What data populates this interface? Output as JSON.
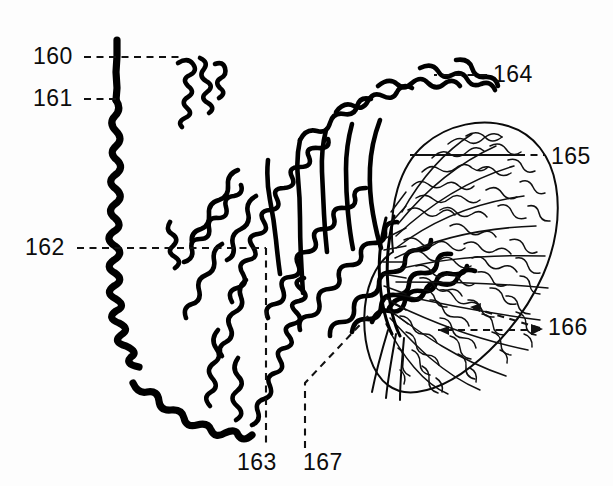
{
  "figure": {
    "background_color": "#fdfdfd",
    "ink_color": "#000000",
    "width": 613,
    "height": 486,
    "style": "patent line drawing"
  },
  "labels": [
    {
      "id": "160",
      "text": "160",
      "x": 33,
      "y": 64,
      "leader": "dashed-horizontal-right"
    },
    {
      "id": "161",
      "text": "161",
      "x": 33,
      "y": 106,
      "leader": "dashed-horizontal-right"
    },
    {
      "id": "162",
      "text": "162",
      "x": 25,
      "y": 255,
      "leader": "dashed-horizontal-right"
    },
    {
      "id": "163",
      "text": "163",
      "x": 237,
      "y": 470,
      "leader": "dashed-vertical-up"
    },
    {
      "id": "164",
      "text": "164",
      "x": 493,
      "y": 82,
      "leader": "dashed-horizontal-left"
    },
    {
      "id": "165",
      "text": "165",
      "x": 551,
      "y": 164,
      "leader": "solid-then-dashed-left"
    },
    {
      "id": "166",
      "text": "166",
      "x": 548,
      "y": 335,
      "leader": "dashed-double-arrow-left"
    },
    {
      "id": "167",
      "text": "167",
      "x": 303,
      "y": 470,
      "leader": "dashed-vertical-up-angled"
    }
  ],
  "structures": {
    "extended_fiber": {
      "name": "extended chromatin fiber",
      "described_by": [
        "160",
        "161",
        "162"
      ],
      "stroke": "thick"
    },
    "free_loop": {
      "name": "free loop fragment",
      "described_by": [
        "160"
      ]
    },
    "loop_fan": {
      "name": "radiating chromatin loops",
      "described_by": [
        "163",
        "164"
      ]
    },
    "condensed_mass": {
      "name": "condensed chromosome body",
      "described_by": [
        "165",
        "166"
      ]
    },
    "scaffold_axis": {
      "name": "central scaffold axis",
      "described_by": [
        "167"
      ]
    }
  }
}
